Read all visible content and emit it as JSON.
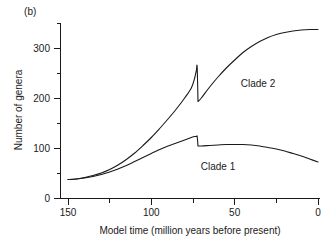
{
  "figure": {
    "panel_label": "(b)"
  },
  "chart_data": {
    "type": "line",
    "title": "",
    "subtitle": "",
    "xlabel": "Model time (million years before present)",
    "ylabel": "Number of genera",
    "xlim": [
      150,
      0
    ],
    "ylim": [
      0,
      350
    ],
    "x_reversed": true,
    "grid": false,
    "legend_position": "inline-annotations",
    "x_ticks_major": [
      150,
      100,
      50,
      0
    ],
    "x_ticks_major_labels": [
      "150",
      "100",
      "50",
      "0"
    ],
    "x_ticks_minor": [
      125,
      75,
      25
    ],
    "y_ticks_major": [
      0,
      100,
      200,
      300
    ],
    "y_ticks_major_labels": [
      "0",
      "100",
      "200",
      "300"
    ],
    "y_ticks_minor": [
      50,
      150,
      250,
      350
    ],
    "annotations": [
      {
        "text": "Clade 2",
        "x": 36,
        "y": 222
      },
      {
        "text": "Clade 1",
        "x": 60,
        "y": 56
      }
    ],
    "series": [
      {
        "name": "Clade 1",
        "x": [
          150,
          145,
          140,
          135,
          130,
          125,
          120,
          115,
          110,
          105,
          100,
          95,
          90,
          85,
          80,
          76,
          74,
          73,
          72.5,
          72,
          70,
          65,
          60,
          55,
          50,
          45,
          40,
          35,
          30,
          25,
          20,
          15,
          10,
          5,
          0
        ],
        "values": [
          37,
          38,
          40,
          43,
          47,
          52,
          58,
          65,
          73,
          81,
          89,
          97,
          104,
          110,
          116,
          121,
          123,
          123,
          123,
          104,
          104,
          105,
          106,
          107,
          107,
          107,
          106,
          104,
          101,
          98,
          94,
          89,
          84,
          78,
          72
        ]
      },
      {
        "name": "Clade 2",
        "x": [
          150,
          145,
          140,
          135,
          130,
          125,
          120,
          115,
          110,
          105,
          100,
          95,
          90,
          85,
          80,
          76,
          74,
          73,
          72.5,
          72,
          70,
          65,
          60,
          55,
          50,
          45,
          40,
          35,
          30,
          25,
          20,
          15,
          10,
          5,
          0
        ],
        "values": [
          37,
          38,
          41,
          45,
          50,
          57,
          66,
          77,
          90,
          105,
          121,
          139,
          158,
          178,
          200,
          220,
          240,
          255,
          262,
          193,
          200,
          222,
          242,
          260,
          276,
          291,
          303,
          313,
          321,
          327,
          331,
          334,
          336,
          337,
          337
        ]
      }
    ]
  }
}
